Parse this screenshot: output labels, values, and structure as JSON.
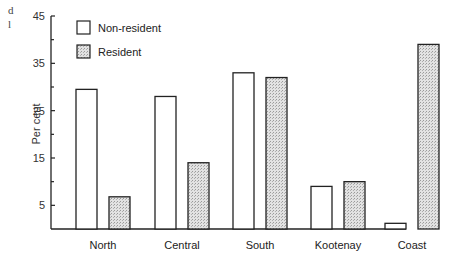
{
  "page_fragments": [
    "d",
    "l"
  ],
  "chart_data": {
    "type": "bar",
    "title": "",
    "xlabel": "",
    "ylabel": "Per cent",
    "ylim": [
      0,
      45
    ],
    "yticks_labeled": [
      5,
      15,
      25,
      35,
      45
    ],
    "yticks_minor": [
      10,
      20,
      30,
      40
    ],
    "grid": false,
    "legend_position": "top-left",
    "categories": [
      "North",
      "Central",
      "South",
      "Kootenay",
      "Coast"
    ],
    "series": [
      {
        "name": "Non-resident",
        "fill": "white",
        "values": [
          29.5,
          28,
          33,
          9,
          1.2
        ]
      },
      {
        "name": "Resident",
        "fill": "stippled grey",
        "values": [
          6.8,
          14,
          32,
          10,
          39
        ]
      }
    ]
  }
}
